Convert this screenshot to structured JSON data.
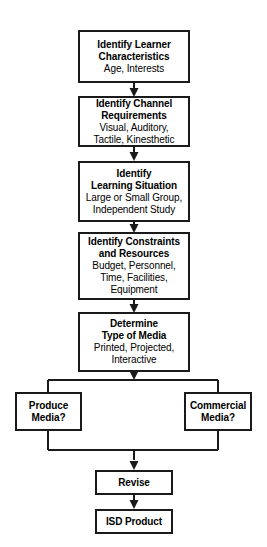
{
  "diagram": {
    "background_color": "#ffffff",
    "line_color": "#1a1a1a",
    "nodes": [
      {
        "id": "learner",
        "title": "Identify Learner\nCharacteristics",
        "subtitle": "Age, Interests"
      },
      {
        "id": "channel",
        "title": "Identify Channel\nRequirements",
        "subtitle": "Visual, Auditory,\nTactile, Kinesthetic"
      },
      {
        "id": "situation",
        "title": "Identify\nLearning Situation",
        "subtitle": "Large or Small Group,\nIndependent Study"
      },
      {
        "id": "constraints",
        "title": "Identify Constraints\nand Resources",
        "subtitle": "Budget, Personnel,\nTime, Facilities,\nEquipment"
      },
      {
        "id": "media",
        "title": "Determine\nType of Media",
        "subtitle": "Printed, Projected,\nInteractive"
      },
      {
        "id": "produce",
        "title": "Produce\nMedia?",
        "subtitle": ""
      },
      {
        "id": "commercial",
        "title": "Commercial\nMedia?",
        "subtitle": ""
      },
      {
        "id": "revise",
        "title": "Revise",
        "subtitle": ""
      },
      {
        "id": "product",
        "title": "ISD Product",
        "subtitle": ""
      }
    ]
  }
}
